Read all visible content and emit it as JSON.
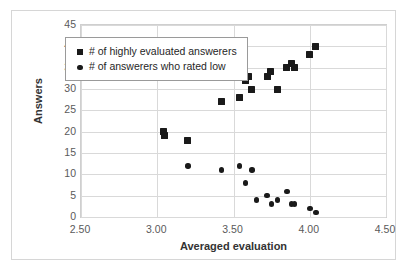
{
  "chart_data": {
    "type": "scatter",
    "title": "",
    "xlabel": "Averaged evaluation",
    "ylabel": "Answers",
    "xlim": [
      2.5,
      4.5
    ],
    "ylim": [
      0,
      45
    ],
    "xticks": [
      "2.50",
      "3.00",
      "3.50",
      "4.00",
      "4.50"
    ],
    "xtick_values": [
      2.5,
      3.0,
      3.5,
      4.0,
      4.5
    ],
    "yticks": [
      "0",
      "5",
      "10",
      "15",
      "20",
      "25",
      "30",
      "35",
      "40",
      "45"
    ],
    "ytick_values": [
      0,
      5,
      10,
      15,
      20,
      25,
      30,
      35,
      40,
      45
    ],
    "grid": "horizontal-and-vertical",
    "legend_position": "upper-left-inside",
    "marker_color": "#1a1a1a",
    "series": [
      {
        "name": "# of highly evaluated answerers",
        "marker": "square",
        "points": [
          [
            3.04,
            20
          ],
          [
            3.05,
            19
          ],
          [
            3.2,
            18
          ],
          [
            3.42,
            27
          ],
          [
            3.54,
            28
          ],
          [
            3.58,
            32
          ],
          [
            3.6,
            33
          ],
          [
            3.62,
            30
          ],
          [
            3.72,
            33
          ],
          [
            3.74,
            34
          ],
          [
            3.79,
            30
          ],
          [
            3.85,
            35
          ],
          [
            3.88,
            36
          ],
          [
            3.9,
            35
          ],
          [
            4.0,
            38
          ],
          [
            4.04,
            40
          ]
        ]
      },
      {
        "name": "# of answerers who rated low",
        "marker": "circle",
        "points": [
          [
            3.2,
            12
          ],
          [
            3.42,
            11
          ],
          [
            3.54,
            12
          ],
          [
            3.58,
            8
          ],
          [
            3.62,
            11
          ],
          [
            3.65,
            4
          ],
          [
            3.72,
            5
          ],
          [
            3.75,
            3
          ],
          [
            3.79,
            4
          ],
          [
            3.85,
            6
          ],
          [
            3.88,
            3
          ],
          [
            3.9,
            3
          ],
          [
            4.0,
            2
          ],
          [
            4.04,
            1
          ]
        ]
      }
    ]
  },
  "legend": {
    "items": [
      {
        "label": "# of highly evaluated answerers",
        "marker": "square"
      },
      {
        "label": "# of answerers who rated low",
        "marker": "circle"
      }
    ]
  }
}
